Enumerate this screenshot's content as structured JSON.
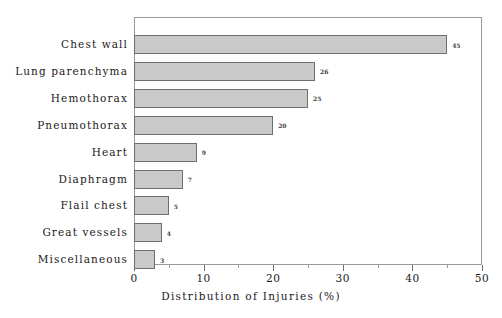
{
  "chart_data": {
    "type": "bar",
    "orientation": "horizontal",
    "title": "",
    "xlabel": "Distribution of Injuries (%)",
    "ylabel": "",
    "xlim": [
      0,
      50
    ],
    "xticks": [
      0,
      10,
      20,
      30,
      40,
      50
    ],
    "xtick_labels": [
      "0",
      "10",
      "20",
      "30",
      "40",
      "50"
    ],
    "minor_xticks": [
      5,
      15,
      25,
      35,
      45
    ],
    "grid": false,
    "legend": null,
    "categories": [
      "Chest wall",
      "Lung parenchyma",
      "Hemothorax",
      "Pneumothorax",
      "Heart",
      "Diaphragm",
      "Flail chest",
      "Great vessels",
      "Miscellaneous"
    ],
    "values": [
      45,
      26,
      25,
      20,
      9,
      7,
      5,
      4,
      3
    ],
    "value_labels": [
      "45",
      "26",
      "25",
      "20",
      "9",
      "7",
      "5",
      "4",
      "3"
    ],
    "bar_fill_color": "#c9c9c9",
    "bar_edge_color": "#6e6e6e",
    "axis_color": "#9a9a9a",
    "text_color": "#1a1a1a",
    "background_color": "#ffffff"
  }
}
